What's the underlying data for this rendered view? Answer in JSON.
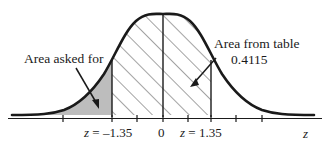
{
  "figure": {
    "labels": {
      "area_asked_for": "Area asked for",
      "area_from_table": "Area from table",
      "area_from_table_value": "0.4115"
    },
    "axis": {
      "name": "z",
      "tick_negative": "z = –1.35",
      "tick_zero": "0",
      "tick_positive": "z = 1.35"
    },
    "colors": {
      "curve": "#1a1a1a",
      "shaded_tail_fill": "#bdbdbd",
      "hatch_line": "#555555",
      "text": "#1a1a1a",
      "background": "#ffffff"
    }
  },
  "chart_data": {
    "type": "area",
    "xlabel": "z",
    "ylabel": "",
    "distribution": "standard normal",
    "mean": 0,
    "sd": 1,
    "xlim": [
      -3.6,
      3.6
    ],
    "ylim": [
      0,
      0.42
    ],
    "grid": false,
    "legend": null,
    "tick_values": [
      -1.35,
      0,
      1.35
    ],
    "tick_labels": [
      "z = –1.35",
      "0",
      "z = 1.35"
    ],
    "regions": [
      {
        "name": "Area asked for",
        "style": "solid-gray-fill",
        "from": "-infinity",
        "to": -1.35,
        "value": null
      },
      {
        "name": "Area from table",
        "style": "diagonal-hatch",
        "from": -1.35,
        "to": 1.35,
        "value": 0.4115
      }
    ],
    "annotations": [
      {
        "text": "Area asked for",
        "points_to": "left tail region below z = -1.35",
        "arrow": true
      },
      {
        "text": "Area from table 0.4115",
        "points_to": "hatched region between z = -1.35 and z = 1.35",
        "arrow": true
      }
    ]
  }
}
